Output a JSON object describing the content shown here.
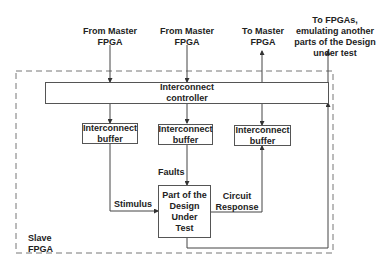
{
  "diagram": {
    "inputs": [
      {
        "id": "from-master-1",
        "label": "From Master FPGA"
      },
      {
        "id": "from-master-2",
        "label": "From Master FPGA"
      },
      {
        "id": "to-master",
        "label": "To Master FPGA"
      },
      {
        "id": "to-fpgas",
        "label": "To FPGAs, emulating another parts of the Design under test"
      }
    ],
    "container": {
      "label_line1": "Slave",
      "label_line2": "FPGA"
    },
    "controller": {
      "line1": "Interconnect",
      "line2": "controller"
    },
    "buffers": [
      {
        "line1": "Interconnect",
        "line2": "buffer"
      },
      {
        "line1": "Interconnect",
        "line2": "buffer"
      },
      {
        "line1": "Interconnect",
        "line2": "buffer"
      }
    ],
    "dut": {
      "line1": "Part of the",
      "line2": "Design Under",
      "line3": "Test"
    },
    "edge_labels": {
      "stimulus": "Stimulus",
      "faults": "Faults",
      "circuit_response_1": "Circuit",
      "circuit_response_2": "Response"
    },
    "top_labels": {
      "from_master_1_l1": "From Master",
      "from_master_1_l2": "FPGA",
      "from_master_2_l1": "From Master",
      "from_master_2_l2": "FPGA",
      "to_master_l1": "To Master",
      "to_master_l2": "FPGA",
      "to_fpgas_l1": "To FPGAs,",
      "to_fpgas_l2": "emulating another",
      "to_fpgas_l3": "parts of the Design",
      "to_fpgas_l4": "under test"
    },
    "colors": {
      "line": "#444444",
      "dashed": "#777777",
      "text": "#222222"
    }
  }
}
